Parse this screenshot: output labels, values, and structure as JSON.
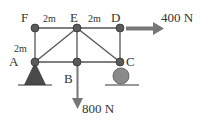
{
  "diagram": {
    "type": "truss",
    "nodes": [
      {
        "id": "F",
        "label": "F"
      },
      {
        "id": "E",
        "label": "E"
      },
      {
        "id": "D",
        "label": "D"
      },
      {
        "id": "A",
        "label": "A"
      },
      {
        "id": "B",
        "label": "B"
      },
      {
        "id": "C",
        "label": "C"
      }
    ],
    "members": [
      [
        "F",
        "E"
      ],
      [
        "E",
        "D"
      ],
      [
        "A",
        "B"
      ],
      [
        "B",
        "C"
      ],
      [
        "F",
        "A"
      ],
      [
        "E",
        "B"
      ],
      [
        "D",
        "C"
      ],
      [
        "A",
        "E"
      ],
      [
        "E",
        "C"
      ]
    ],
    "dimensions": {
      "FE": "2m",
      "ED": "2m",
      "FA": "2m"
    },
    "supports": {
      "A": "pin",
      "C": "roller"
    },
    "loads": {
      "horizontal": {
        "node": "D",
        "label": "400 N",
        "direction": "right"
      },
      "vertical": {
        "node": "B",
        "label": "800 N",
        "direction": "down"
      }
    },
    "colors": {
      "member": "#555555",
      "node": "#5a5a5a",
      "pin_support": "#4a4a4a",
      "roller": "#8a8a8a",
      "arrow": "#777777",
      "ground": "#333333"
    }
  }
}
